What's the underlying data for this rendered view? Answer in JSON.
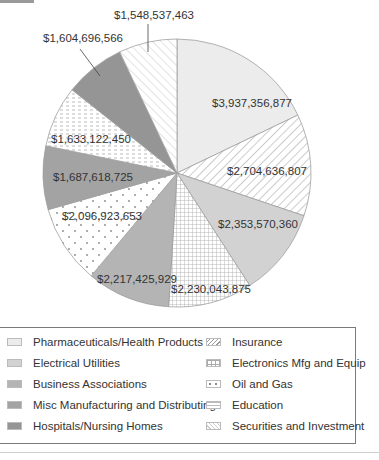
{
  "chart_data": {
    "type": "pie",
    "title": "",
    "start_angle": "12 o'clock, clockwise",
    "legend_position": "bottom",
    "slices": [
      {
        "label": "Pharmaceuticals/Health Products",
        "value": 3937356877,
        "display": "$3,937,356,877",
        "pattern": "light-gray-solid",
        "color": "#ececec"
      },
      {
        "label": "Insurance",
        "value": 2704636807,
        "display": "$2,704,636,807",
        "pattern": "diagonal-hatch",
        "color": "#ffffff"
      },
      {
        "label": "Electrical Utilities",
        "value": 2353570360,
        "display": "$2,353,570,360",
        "pattern": "solid",
        "color": "#d2d2d2"
      },
      {
        "label": "Electronics Mfg and Equip",
        "value": 2230043875,
        "display": "$2,230,043,875",
        "pattern": "grid",
        "color": "#ffffff"
      },
      {
        "label": "Business Associations",
        "value": 2217425929,
        "display": "$2,217,425,929",
        "pattern": "solid",
        "color": "#b4b4b4"
      },
      {
        "label": "Oil and Gas",
        "value": 2096923653,
        "display": "$2,096,923,653",
        "pattern": "dots",
        "color": "#ffffff"
      },
      {
        "label": "Misc Manufacturing and Distributing",
        "value": 1687618725,
        "display": "$1,687,618,725",
        "pattern": "solid",
        "color": "#a3a3a3"
      },
      {
        "label": "Education",
        "value": 1633122450,
        "display": "$1,633,122,450",
        "pattern": "dashes",
        "color": "#ffffff"
      },
      {
        "label": "Hospitals/Nursing Homes",
        "value": 1604696566,
        "display": "$1,604,696,566",
        "pattern": "solid",
        "color": "#959595"
      },
      {
        "label": "Securities and Investment",
        "value": 1548537463,
        "display": "$1,548,537,463",
        "pattern": "diagonal-hatch-reverse",
        "color": "#ffffff"
      }
    ]
  },
  "labels": {
    "pharma": "$3,937,356,877",
    "insurance": "$2,704,636,807",
    "electrical": "$2,353,570,360",
    "electronics": "$2,230,043,875",
    "business": "$2,217,425,929",
    "oil": "$2,096,923,653",
    "misc": "$1,687,618,725",
    "education": "$1,633,122,450",
    "hospitals": "$1,604,696,566",
    "securities": "$1,548,537,463"
  },
  "legend": {
    "left": [
      "Pharmaceuticals/Health Products",
      "Electrical Utilities",
      "Business Associations",
      "Misc Manufacturing and Distributing",
      "Hospitals/Nursing Homes"
    ],
    "right": [
      "Insurance",
      "Electronics Mfg and Equip",
      "Oil and Gas",
      "Education",
      "Securities and Investment"
    ]
  }
}
